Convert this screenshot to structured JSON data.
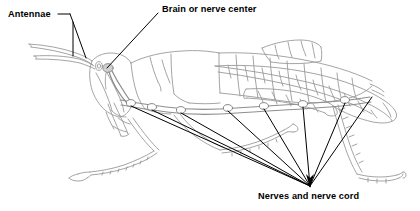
{
  "diagram": {
    "style": "line drawing",
    "background_color": "#ffffff",
    "drawing_stroke_color": "#9a9a9a",
    "leader_line_color": "#000000",
    "label_text_color": "#000000"
  },
  "labels": {
    "antennae": "Antennae",
    "brain": "Brain or nerve center",
    "nerves": "Nerves and nerve cord"
  },
  "annotations": [
    {
      "name": "antennae",
      "text": "Antennae",
      "text_x": 8,
      "text_y": 10,
      "leader_from": [
        64,
        14
      ],
      "targets": [
        [
          78,
          52
        ],
        [
          86,
          60
        ]
      ],
      "style": "forked-bracket"
    },
    {
      "name": "brain",
      "text": "Brain or nerve center",
      "text_x": 162,
      "text_y": 5,
      "leader_from": [
        158,
        12
      ],
      "targets": [
        [
          107,
          68
        ]
      ],
      "style": "single-line"
    },
    {
      "name": "nerves-and-nerve-cord",
      "text": "Nerves and nerve cord",
      "text_x": 258,
      "text_y": 192,
      "leader_from": [
        310,
        186
      ],
      "arrowhead_at": [
        310,
        186
      ],
      "targets": [
        [
          131,
          103
        ],
        [
          152,
          107
        ],
        [
          181,
          110
        ],
        [
          228,
          108
        ],
        [
          264,
          106
        ],
        [
          303,
          104
        ],
        [
          345,
          100
        ],
        [
          370,
          97
        ]
      ],
      "style": "fan-of-lines-with-arrow"
    }
  ],
  "anatomy": {
    "ganglia_count": 7,
    "ganglia_positions": [
      [
        131,
        103
      ],
      [
        152,
        107
      ],
      [
        181,
        110
      ],
      [
        228,
        108
      ],
      [
        264,
        106
      ],
      [
        303,
        104
      ],
      [
        345,
        100
      ]
    ],
    "brain_position": [
      107,
      68
    ],
    "eye_position": [
      99,
      66
    ],
    "parts": [
      "antennae",
      "head",
      "compound eye",
      "brain",
      "mouthparts",
      "pronotum",
      "thorax",
      "abdomen segments",
      "forewing",
      "foreleg",
      "middle leg",
      "hind leg femur",
      "hind leg tibia",
      "tarsus",
      "ventral nerve cord",
      "ganglia"
    ]
  }
}
